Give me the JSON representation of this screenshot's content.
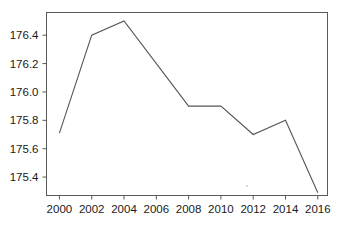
{
  "chart_data": {
    "type": "line",
    "title": "",
    "subtitle": "",
    "xlabel": "",
    "ylabel": "",
    "legend": [],
    "legend_position": "none",
    "grid": false,
    "x": [
      2000,
      2002,
      2004,
      2006,
      2008,
      2010,
      2012,
      2014,
      2016
    ],
    "values": [
      175.71,
      176.4,
      176.5,
      176.2,
      175.9,
      175.9,
      175.7,
      175.8,
      175.29
    ],
    "vertices": [
      {
        "x": 2000,
        "y": 175.71
      },
      {
        "x": 2002,
        "y": 176.4
      },
      {
        "x": 2004,
        "y": 176.5
      },
      {
        "x": 2008,
        "y": 175.9
      },
      {
        "x": 2010,
        "y": 175.9
      },
      {
        "x": 2012,
        "y": 175.7
      },
      {
        "x": 2014,
        "y": 175.8
      },
      {
        "x": 2016,
        "y": 175.29
      }
    ],
    "xlim": [
      1999.2,
      2016.6
    ],
    "ylim": [
      175.27,
      176.56
    ],
    "xticks": [
      2000,
      2002,
      2004,
      2006,
      2008,
      2010,
      2012,
      2014,
      2016
    ],
    "xticklabels": [
      "2000",
      "2002",
      "2004",
      "2006",
      "2008",
      "2010",
      "2012",
      "2014",
      "2016"
    ],
    "yticks": [
      175.4,
      175.6,
      175.8,
      176.0,
      176.2,
      176.4
    ],
    "yticklabels": [
      "175.4",
      "175.6",
      "175.8",
      "176.0",
      "176.2",
      "176.4"
    ],
    "series": [
      {
        "name": "",
        "color": "#555555",
        "values": [
          175.71,
          176.4,
          176.5,
          176.2,
          175.9,
          175.9,
          175.7,
          175.8,
          175.29
        ]
      }
    ]
  },
  "style": {
    "line_color": "#555555",
    "frame_color": "#5a5a5a",
    "text_color": "#1a1a1a",
    "background": "#ffffff"
  }
}
